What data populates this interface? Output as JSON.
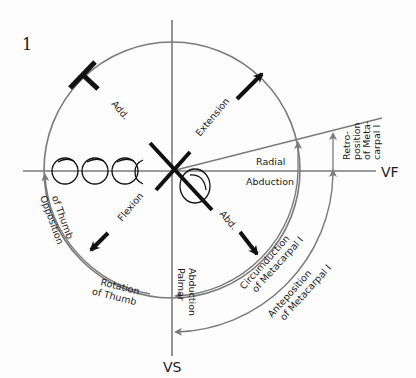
{
  "figure": {
    "number": "1",
    "axes": {
      "horizontal": "VF",
      "vertical": "VS"
    },
    "labels": {
      "add": "Add.",
      "extension": "Extension",
      "radial": "Radial",
      "abduction": "Abduction",
      "retro1": "Retro-",
      "retro2": "position",
      "retro3": "of Meta-",
      "retro4": "carpal I",
      "opposition1": "Opposition",
      "opposition2": "of Thumb",
      "flexion": "Flexion",
      "abd": "Abd.",
      "palmar": "Palmar",
      "palmar_abduction": "Abduction",
      "rotation1": "Rotation",
      "rotation2": "of Thumb",
      "circum1": "Circumduction",
      "circum2": "of Metacarpal I",
      "ante1": "Anteposition",
      "ante2": "of Metacarpal I"
    },
    "colors": {
      "line": "#7a7a7a",
      "ink": "#111111"
    }
  }
}
